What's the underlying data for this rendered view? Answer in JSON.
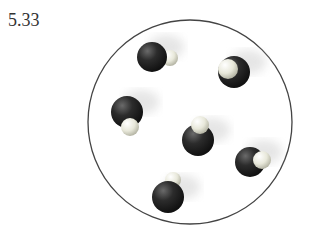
{
  "problem_number": "5.33",
  "container": {
    "shape": "circle",
    "cx": 190,
    "cy": 122,
    "r": 102,
    "stroke": "#444"
  },
  "molecules": [
    {
      "name": "molecule-1",
      "dark": {
        "cx": 152,
        "cy": 57,
        "r": 15
      },
      "light": {
        "cx": 170,
        "cy": 58,
        "r": 8,
        "front": false
      }
    },
    {
      "name": "molecule-2",
      "dark": {
        "cx": 234,
        "cy": 72,
        "r": 16
      },
      "light": {
        "cx": 228,
        "cy": 69,
        "r": 10,
        "front": true
      }
    },
    {
      "name": "molecule-3",
      "dark": {
        "cx": 127,
        "cy": 112,
        "r": 16
      },
      "light": {
        "cx": 130,
        "cy": 127,
        "r": 9,
        "front": true
      }
    },
    {
      "name": "molecule-4",
      "dark": {
        "cx": 198,
        "cy": 140,
        "r": 16
      },
      "light": {
        "cx": 200,
        "cy": 125,
        "r": 9,
        "front": true
      }
    },
    {
      "name": "molecule-5",
      "dark": {
        "cx": 250,
        "cy": 162,
        "r": 15
      },
      "light": {
        "cx": 262,
        "cy": 160,
        "r": 9,
        "front": true
      }
    },
    {
      "name": "molecule-6",
      "dark": {
        "cx": 168,
        "cy": 197,
        "r": 16
      },
      "light": {
        "cx": 173,
        "cy": 180,
        "r": 8,
        "front": false
      }
    }
  ],
  "colors": {
    "dark": "#2a2a2a",
    "light": "#e6e6d8"
  }
}
